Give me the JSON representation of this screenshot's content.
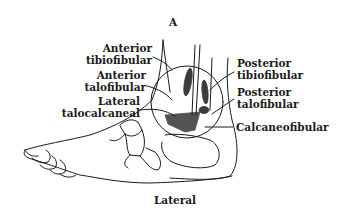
{
  "figure": {
    "panel_letter": "A",
    "view_caption": "Lateral"
  },
  "labels_left": [
    {
      "line1": "Anterior",
      "line2": "tibiofibular"
    },
    {
      "line1": "Anterior",
      "line2": "talofibular"
    },
    {
      "line1": "Lateral",
      "line2": "talocalcaneal"
    }
  ],
  "labels_right": [
    {
      "line1": "Posterior",
      "line2": "tibiofibular"
    },
    {
      "line1": "Posterior",
      "line2": "talofibular"
    },
    {
      "line1": "Calcaneofibular",
      "line2": ""
    }
  ],
  "colors": {
    "ink": "#1a1a1a",
    "background": "#ffffff"
  }
}
